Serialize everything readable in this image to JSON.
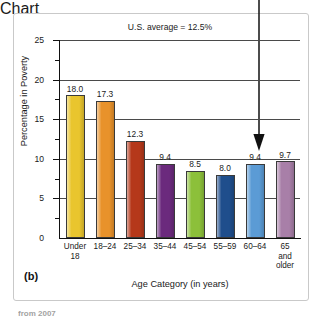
{
  "figure": {
    "panel_label": "(b)",
    "caption_sliver": "from 2007"
  },
  "annotation": {
    "us_average_text": "U.S. average = 12.5%",
    "arrow_target_category": "60–64",
    "arrow_name": "us-average-arrow"
  },
  "axes": {
    "ylabel": "Percentage in Poverty",
    "xlabel": "Age Category (in years)",
    "yticks": [
      25,
      20,
      15,
      10,
      5,
      0
    ],
    "ytick_labels": [
      "25",
      "20",
      "15",
      "10",
      "5",
      "0"
    ]
  },
  "chart_data": {
    "type": "bar",
    "title": "",
    "subtitle": "",
    "xlabel": "Age Category (in years)",
    "ylabel": "Percentage in Poverty",
    "ylim": [
      0,
      25
    ],
    "ytick_step": 5,
    "grid": true,
    "legend": "none",
    "categories": [
      "Under 18",
      "18–24",
      "25–34",
      "35–44",
      "45–54",
      "55–59",
      "60–64",
      "65 and older"
    ],
    "category_lines": [
      [
        "Under",
        "18"
      ],
      [
        "18–24"
      ],
      [
        "25–34"
      ],
      [
        "35–44"
      ],
      [
        "45–54"
      ],
      [
        "55–59"
      ],
      [
        "60–64"
      ],
      [
        "65",
        "and",
        "older"
      ]
    ],
    "values": [
      18.0,
      17.3,
      12.3,
      9.4,
      8.5,
      8.0,
      9.4,
      9.7
    ],
    "value_labels": [
      "18.0",
      "17.3",
      "12.3",
      "9.4",
      "8.5",
      "8.0",
      "9.4",
      "9.7"
    ],
    "colors": [
      "#e9c52e",
      "#e8922b",
      "#b5381a",
      "#6b2a7d",
      "#8cc03a",
      "#1f4e8c",
      "#5b9bd5",
      "#a87fa8"
    ],
    "annotations": [
      {
        "text": "U.S. average = 12.5%",
        "value": 12.5
      }
    ]
  }
}
